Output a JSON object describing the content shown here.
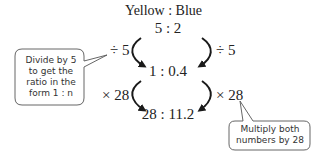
{
  "title": "Yellow : Blue",
  "ratios": [
    "5 : 2",
    "1 : 0.4",
    "28 : 11.2"
  ],
  "operations": {
    "step1_left": "÷ 5",
    "step1_right": "÷ 5",
    "step2_left": "× 28",
    "step2_right": "× 28"
  },
  "callouts": {
    "left": {
      "lines": [
        "Divide by 5",
        "to get the",
        "ratio in the",
        "form 1 : n"
      ]
    },
    "right": {
      "lines": [
        "Multiply both",
        "numbers by 28"
      ]
    }
  },
  "colors": {
    "text": "#222222",
    "arrow": "#1a1a1a",
    "callout_border": "#555555",
    "background": "#ffffff"
  }
}
